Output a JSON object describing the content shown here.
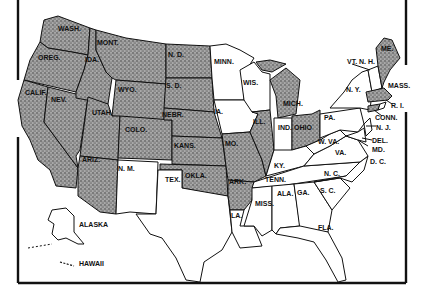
{
  "map": {
    "colors": {
      "shaded": "#8f8f8f",
      "unshaded": "#ffffff",
      "outline": "#111111",
      "background": "#ffffff"
    },
    "legend": "Shaded states vs. unshaded states",
    "labels": {
      "wash": "WASH.",
      "oreg": "OREG.",
      "calif": "CALIF.",
      "idaho": "IDA.",
      "nev": "NEV.",
      "mont": "MONT.",
      "wyo": "WYO.",
      "utah": "UTAH",
      "colo": "COLO.",
      "ariz": "ARIZ.",
      "nm": "N. M.",
      "nd": "N. D.",
      "sd": "S. D.",
      "nebr": "NEBR.",
      "kans": "KANS.",
      "okla": "OKLA.",
      "tex": "TEX.",
      "minn": "MINN.",
      "ia": "IA.",
      "mo": "MO.",
      "ark": "ARK.",
      "la": "LA.",
      "wis": "WIS.",
      "ill": "ILL.",
      "mich": "MICH.",
      "ind": "IND.",
      "ohio": "OHIO",
      "ky": "KY.",
      "tenn": "TENN.",
      "miss": "MISS.",
      "ala": "ALA.",
      "ga": "GA.",
      "fla": "FLA.",
      "sc": "S. C.",
      "nc": "N. C.",
      "va": "VA.",
      "wva": "W. VA.",
      "pa": "PA.",
      "ny": "N. Y.",
      "vt_nh": "VT. N. H.",
      "me": "ME.",
      "mass": "MASS.",
      "ri": "R. I.",
      "conn": "CONN.",
      "nj": "N. J.",
      "del": "DEL.",
      "md": "MD.",
      "dc": "D. C.",
      "alaska": "ALASKA",
      "hawaii": "HAWAII"
    },
    "shaded_states": [
      "WASH.",
      "OREG.",
      "CALIF.",
      "IDA.",
      "NEV.",
      "MONT.",
      "WYO.",
      "UTAH",
      "COLO.",
      "ARIZ.",
      "N. D.",
      "S. D.",
      "NEBR.",
      "KANS.",
      "OKLA.",
      "MO.",
      "ARK.",
      "ILL.",
      "MICH.",
      "OHIO",
      "ME.",
      "MASS.",
      "CONN."
    ],
    "unshaded_states": [
      "N. M.",
      "TEX.",
      "MINN.",
      "IA.",
      "LA.",
      "WIS.",
      "IND.",
      "KY.",
      "TENN.",
      "MISS.",
      "ALA.",
      "GA.",
      "FLA.",
      "S. C.",
      "N. C.",
      "VA.",
      "W. VA.",
      "PA.",
      "N. Y.",
      "VT.",
      "N. H.",
      "R. I.",
      "N. J.",
      "DEL.",
      "MD.",
      "D. C.",
      "ALASKA",
      "HAWAII"
    ]
  }
}
